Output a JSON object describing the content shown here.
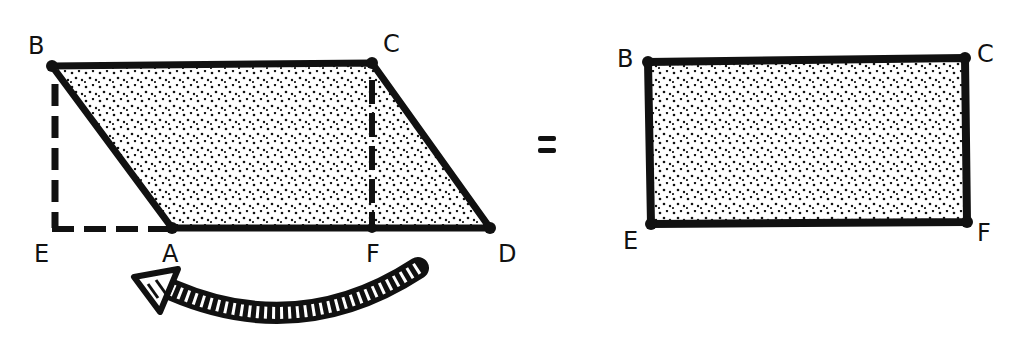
{
  "diagram": {
    "colors": {
      "ink": "#111111",
      "background": "#ffffff"
    },
    "left_figure": {
      "shape": "parallelogram",
      "vertices": [
        "B",
        "C",
        "D",
        "A"
      ],
      "construction_points": [
        "E",
        "F"
      ],
      "labels": {
        "B": "B",
        "C": "C",
        "D": "D",
        "A": "A",
        "E": "E",
        "F": "F"
      },
      "dashed_segments": [
        "B-E",
        "E-A",
        "C-F"
      ],
      "arrow": {
        "from": "F",
        "to": "A",
        "meaning": "move triangle CFD to BEA"
      }
    },
    "operator": "=",
    "right_figure": {
      "shape": "rectangle",
      "vertices": [
        "B",
        "C",
        "F",
        "E"
      ],
      "labels": {
        "B": "B",
        "C": "C",
        "E": "E",
        "F": "F"
      }
    }
  }
}
